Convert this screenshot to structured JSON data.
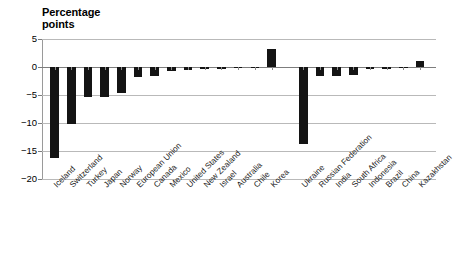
{
  "chart_data": {
    "type": "bar",
    "xlabel": "",
    "ylabel": "Percentage points",
    "ylim": [
      -20,
      5
    ],
    "yticks": [
      5,
      0,
      -5,
      -10,
      -15,
      -20
    ],
    "ytick_labels": [
      "5",
      "0",
      "−5",
      "−10",
      "−15",
      "−20"
    ],
    "grid": true,
    "legend": false,
    "orientation": "vertical",
    "bar_color": "#141414",
    "categories": [
      "Iceland",
      "Switzerland",
      "Turkey",
      "Japan",
      "Norway",
      "European Union",
      "Canada",
      "Mexico",
      "United States",
      "New Zealand",
      "Israel",
      "Australia",
      "Chile",
      "Korea",
      "Ukraine",
      "Russian Federation",
      "India",
      "South Africa",
      "Indonesia",
      "Brazil",
      "China",
      "Kazakhstan"
    ],
    "values": [
      -16.2,
      -10.2,
      -5.3,
      -5.3,
      -4.7,
      -1.8,
      -1.6,
      -0.7,
      -0.6,
      -0.4,
      -0.3,
      -0.2,
      -0.2,
      3.3,
      -13.7,
      -1.6,
      -1.6,
      -1.5,
      -0.4,
      -0.4,
      -0.1,
      1.1
    ],
    "group_gap_after_index": 13
  },
  "axis": {
    "title_line1": "Percentage",
    "title_line2": "points"
  }
}
